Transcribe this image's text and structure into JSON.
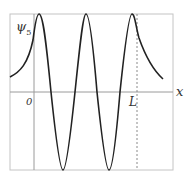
{
  "diagram": {
    "y_label": "ψ",
    "y_label_subscript": "5",
    "x_label": "x",
    "origin_label": "0",
    "well_edge_label": "L",
    "colors": {
      "curve": "#222222",
      "frame": "#bbbbbb",
      "axis": "#999999",
      "dashed": "#888888"
    }
  }
}
